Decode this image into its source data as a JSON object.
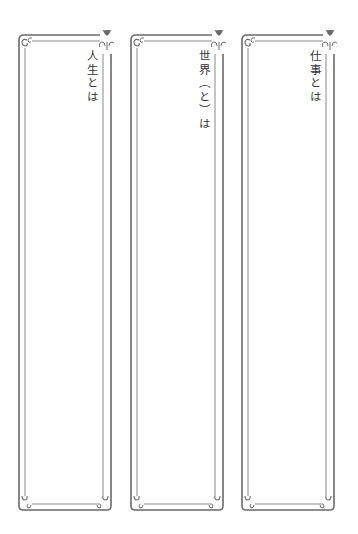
{
  "colors": {
    "frame_line": "#6a6a6a",
    "text": "#333333",
    "background": "#ffffff"
  },
  "frames": [
    {
      "title": "人生とは"
    },
    {
      "title": "世界（と）は"
    },
    {
      "title": "仕事とは"
    }
  ],
  "icons": {
    "corner_ornament": "flourish-scroll-icon",
    "top_ornament": "fleur-de-lis-icon"
  }
}
